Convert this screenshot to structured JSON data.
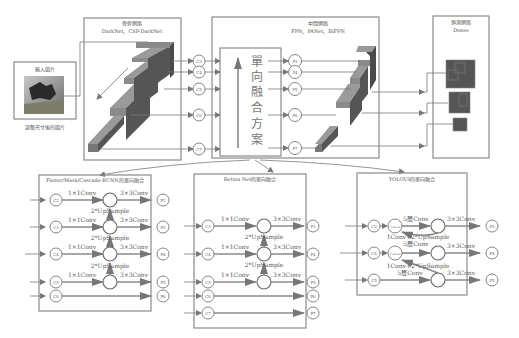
{
  "input": {
    "title": "輸入圖片",
    "caption": "調整尺寸後的圖片"
  },
  "backbone": {
    "title": "骨幹網路",
    "subtitle": "DarkNet、CSP-DarkNet",
    "outputs": [
      "C3",
      "C4",
      "C5",
      "C6",
      "C7"
    ]
  },
  "neck": {
    "title": "中間網路",
    "subtitle": "FPN、PANet、BiFPN",
    "fusion_label": [
      "單",
      "向",
      "融",
      "合",
      "方",
      "案"
    ],
    "outputs": [
      "P3",
      "P4",
      "P5",
      "P6",
      "P7"
    ]
  },
  "head": {
    "title": "預測網路",
    "subtitle": "Dense"
  },
  "panels": [
    {
      "title": "Faster/Mask/Cascade-RCNN的單向融合",
      "inputs": [
        "C2",
        "C3",
        "C4",
        "C5",
        "C6"
      ],
      "outputs": [
        "P2",
        "P3",
        "P4",
        "P5",
        "P6"
      ],
      "lateral": "1×1Conv",
      "smooth": "3×3Conv",
      "upsample": "2*UpSample"
    },
    {
      "title": "Retina Net的單向融合",
      "inputs": [
        "C3",
        "C4",
        "C5",
        "C6",
        "C7"
      ],
      "outputs": [
        "P3",
        "P4",
        "P5",
        "P6",
        "P7"
      ],
      "lateral": "1×1Conv",
      "smooth": "3×3Conv",
      "upsample": "2*UpSample"
    },
    {
      "title": "YOLOV3的單向融合",
      "inputs": [
        "C3",
        "C4",
        "C5"
      ],
      "outputs": [
        "P3",
        "P4",
        "P5"
      ],
      "concat": "Concat",
      "conv5": "5層Conv",
      "smooth": "3×3Conv",
      "upconv": "1Conv+2*UpSample"
    }
  ],
  "colors": {
    "block_top": "#9a9a9a",
    "block_side": "#555555",
    "block_front": "#777777",
    "line": "#7a7a7a",
    "text": "#555555"
  }
}
